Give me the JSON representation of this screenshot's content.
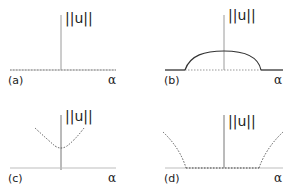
{
  "figure": {
    "panels": [
      {
        "id": "a",
        "label": "(a)",
        "y_label": "||u||",
        "x_label": "α",
        "description": "solution norm zero for all alpha (trivial branch only)"
      },
      {
        "id": "b",
        "label": "(b)",
        "y_label": "||u||",
        "x_label": "α",
        "description": "solid bump: nontrivial branch over finite alpha interval with dotted trivial branch beneath"
      },
      {
        "id": "c",
        "label": "(c)",
        "y_label": "||u||",
        "x_label": "α",
        "description": "dotted parabola-like branch with positive minimum at alpha = 0"
      },
      {
        "id": "d",
        "label": "(d)",
        "y_label": "||u||",
        "x_label": "α",
        "description": "dotted trivial branch on central interval with dotted branches rising outside it"
      }
    ]
  },
  "colors": {
    "axis": "#9a9a9a",
    "curve": "#333333",
    "text": "#222222"
  }
}
